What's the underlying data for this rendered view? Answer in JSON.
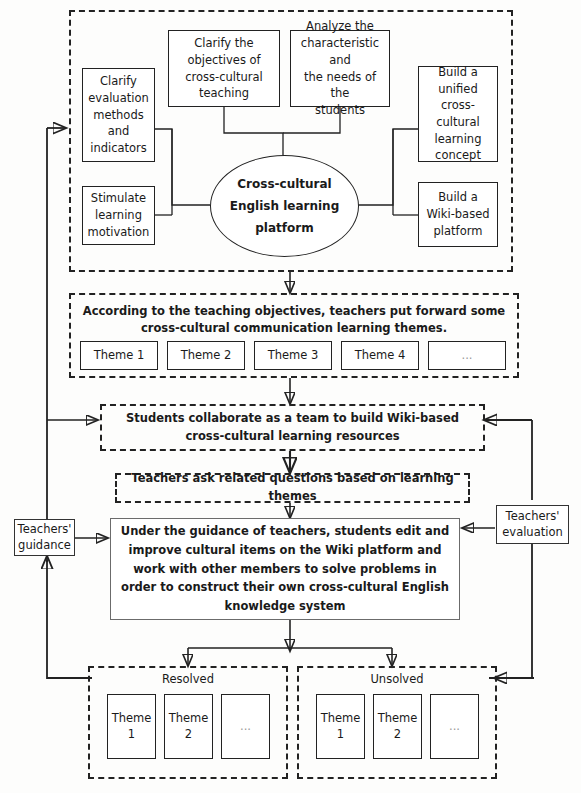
{
  "diagram": {
    "center_node": "Cross-cultural\nEnglish learning\nplatform",
    "center_node_lines": [
      "Cross-cultural",
      "English learning",
      "platform"
    ],
    "top_region": {
      "boxes": [
        {
          "id": "clarify-evaluation",
          "label": "Clarify\nevaluation\nmethods\nand\nindicators"
        },
        {
          "id": "stimulate-motivation",
          "label": "Stimulate\nlearning\nmotivation"
        },
        {
          "id": "clarify-objectives",
          "label": "Clarify the\nobjectives of\ncross-cultural\nteaching"
        },
        {
          "id": "analyze-characteristic",
          "label": "Analyze the\ncharacteristic and\nthe needs of the\nstudents"
        },
        {
          "id": "build-unified-concept",
          "label": "Build a\nunified cross-\ncultural\nlearning\nconcept"
        },
        {
          "id": "build-wiki-platform",
          "label": "Build a\nWiki-based\nplatform"
        }
      ]
    },
    "themes_region": {
      "heading": "According to the teaching objectives, teachers put forward some cross-cultural communication learning themes.",
      "themes": [
        "Theme 1",
        "Theme 2",
        "Theme 3",
        "Theme 4",
        "..."
      ]
    },
    "collaborate_step": "Students collaborate as a team to build Wiki-based cross-cultural learning resources",
    "questions_step": "Teachers ask related questions based on learning themes",
    "main_step": "Under the guidance of teachers, students edit and improve cultural items on the Wiki platform and work with other members to solve problems in order to construct their own cross-cultural English knowledge system",
    "side_nodes": {
      "guidance": "Teachers'\nguidance",
      "evaluation": "Teachers'\nevaluation"
    },
    "outcome_regions": [
      {
        "id": "resolved",
        "label": "Resolved",
        "themes": [
          "Theme\n1",
          "Theme\n2",
          "..."
        ]
      },
      {
        "id": "unsolved",
        "label": "Unsolved",
        "themes": [
          "Theme\n1",
          "Theme\n2",
          "..."
        ]
      }
    ],
    "colors": {
      "stroke": "#222222",
      "box_fill": "#ffffff",
      "background": "#fdfdfc"
    }
  }
}
